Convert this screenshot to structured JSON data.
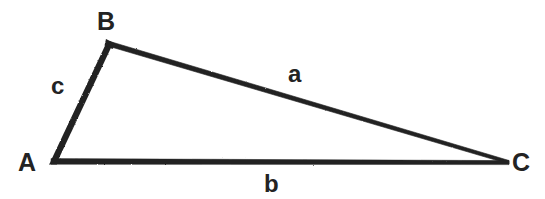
{
  "diagram": {
    "kind": "geometry-figure",
    "name": "Triangle ABC",
    "background_color": "#ffffff",
    "ink_color": "#232323",
    "stroke_width_px": 6,
    "canvas": {
      "width": 545,
      "height": 199
    },
    "vertices": [
      {
        "id": "A",
        "label": "A",
        "x": 52,
        "y": 162
      },
      {
        "id": "B",
        "label": "B",
        "x": 110,
        "y": 42
      },
      {
        "id": "C",
        "label": "C",
        "x": 508,
        "y": 162
      }
    ],
    "sides": [
      {
        "id": "a",
        "label": "a",
        "from": "B",
        "to": "C",
        "opposite_vertex": "A",
        "label_x": 298,
        "label_y": 75
      },
      {
        "id": "b",
        "label": "b",
        "from": "A",
        "to": "C",
        "opposite_vertex": "B",
        "label_x": 274,
        "label_y": 185
      },
      {
        "id": "c",
        "label": "c",
        "from": "A",
        "to": "B",
        "opposite_vertex": "C",
        "label_x": 60,
        "label_y": 86
      }
    ]
  }
}
